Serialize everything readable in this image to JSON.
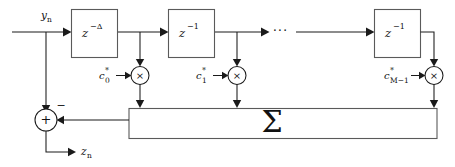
{
  "diagram": {
    "background_color": "#ffffff",
    "line_color": "#1a1a1a",
    "box_stroke_color": "#5a5a5a",
    "input": {
      "label_base": "y",
      "label_sub": "n",
      "name": "input-signal-yn"
    },
    "output": {
      "label_base": "z",
      "label_sub": "n",
      "name": "output-signal-zn"
    },
    "delay_blocks": [
      {
        "base": "z",
        "exponent": "−Δ",
        "name": "delay-block-delta"
      },
      {
        "base": "z",
        "exponent": "−1",
        "name": "delay-block-1"
      },
      {
        "base": "z",
        "exponent": "−1",
        "name": "delay-block-m-1"
      }
    ],
    "ellipsis": "···",
    "coefficients": [
      {
        "base": "c",
        "star": "*",
        "sub": "0",
        "name": "coefficient-c0"
      },
      {
        "base": "c",
        "star": "*",
        "sub": "1",
        "name": "coefficient-c1"
      },
      {
        "base": "c",
        "star": "*",
        "sub": "M−1",
        "name": "coefficient-cm1"
      }
    ],
    "multiplier_symbol": "×",
    "summation_symbol": "Σ",
    "adder": {
      "plus_symbol": "+",
      "minus_symbol": "−",
      "name": "adder-node"
    }
  }
}
